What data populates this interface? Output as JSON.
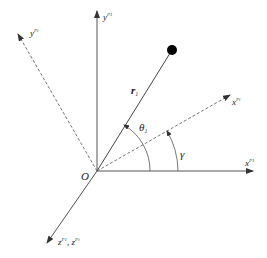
{
  "diagram": {
    "origin": {
      "label": "O",
      "x": 97,
      "y": 171
    },
    "axes": {
      "y_fixed": {
        "label": "y",
        "superscript": "P1",
        "style": "solid"
      },
      "x_fixed": {
        "label": "x",
        "superscript": "P1",
        "style": "solid"
      },
      "y_rotated": {
        "label": "y",
        "superscript": "Pi",
        "style": "dashed"
      },
      "x_rotated": {
        "label": "x",
        "superscript": "Pi",
        "style": "dashed"
      },
      "z": {
        "label": "z",
        "superscript": "P1",
        "separator": ", ",
        "label2": "z",
        "superscript2": "Pi",
        "style": "solid"
      }
    },
    "vector": {
      "label": "r",
      "subscript": "1",
      "style": "solid",
      "endpoint": "filled-dot"
    },
    "angles": {
      "theta": {
        "label": "θ",
        "subscript": "1"
      },
      "gamma": {
        "label": "γ"
      }
    },
    "colors": {
      "line": "#555555",
      "dashed": "#777777",
      "dot": "#000000"
    }
  }
}
